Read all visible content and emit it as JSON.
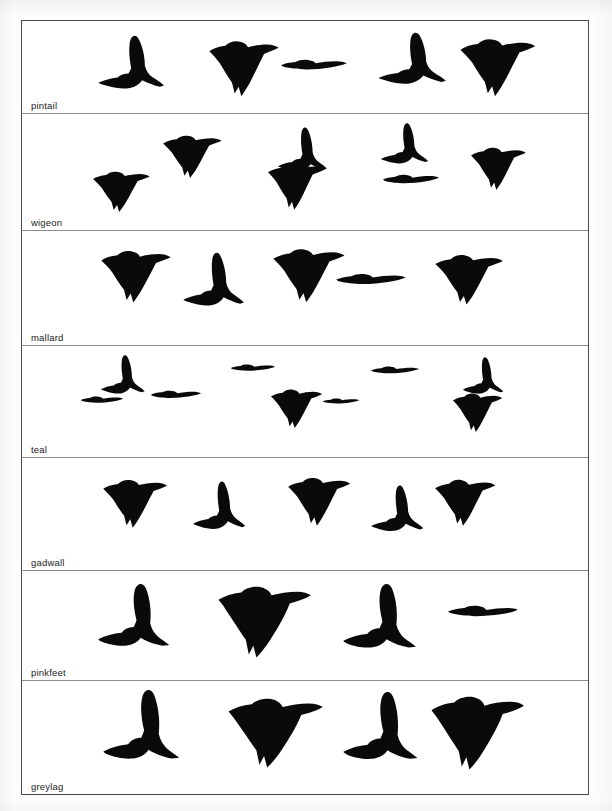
{
  "document": {
    "kind": "bird-identification-silhouette-chart",
    "subject": "wildfowl in flight silhouettes",
    "background_color": "#ffffff",
    "silhouette_color": "#0a0a0a",
    "frame_border_color": "#4a4a4a",
    "row_divider_color": "#8d8d8d"
  },
  "rows": [
    {
      "id": "pintail",
      "label": "pintail",
      "top": 0,
      "height": 93,
      "birds": [
        {
          "name": "bird-silhouette",
          "pose": "wings-up-left",
          "x": 75,
          "y": 13,
          "w": 78,
          "h": 58,
          "scale": 1.0,
          "flip": false,
          "variant": "wings-raised"
        },
        {
          "name": "bird-silhouette",
          "pose": "wings-down",
          "x": 186,
          "y": 18,
          "w": 76,
          "h": 60,
          "scale": 1.0,
          "flip": false,
          "variant": "wings-down-fan"
        },
        {
          "name": "bird-silhouette",
          "pose": "level-glide",
          "x": 258,
          "y": 38,
          "w": 68,
          "h": 34,
          "scale": 1.0,
          "flip": false,
          "variant": "level"
        },
        {
          "name": "bird-silhouette",
          "pose": "wings-up",
          "x": 355,
          "y": 10,
          "w": 80,
          "h": 56,
          "scale": 1.0,
          "flip": false,
          "variant": "wings-raised"
        },
        {
          "name": "bird-silhouette",
          "pose": "wings-down",
          "x": 437,
          "y": 16,
          "w": 82,
          "h": 62,
          "scale": 1.0,
          "flip": false,
          "variant": "wings-down-fan"
        }
      ]
    },
    {
      "id": "wigeon",
      "label": "wigeon",
      "top": 93,
      "height": 117,
      "birds": [
        {
          "name": "bird-silhouette",
          "pose": "wings-down",
          "x": 70,
          "y": 56,
          "w": 62,
          "h": 44,
          "scale": 1.0,
          "flip": false,
          "variant": "wings-down-fan"
        },
        {
          "name": "bird-silhouette",
          "pose": "wings-down",
          "x": 140,
          "y": 20,
          "w": 64,
          "h": 46,
          "scale": 1.0,
          "flip": false,
          "variant": "wings-down-fan"
        },
        {
          "name": "bird-silhouette",
          "pose": "wings-up",
          "x": 255,
          "y": 12,
          "w": 58,
          "h": 48,
          "scale": 1.0,
          "flip": false,
          "variant": "wings-raised"
        },
        {
          "name": "bird-silhouette",
          "pose": "wings-down",
          "x": 245,
          "y": 48,
          "w": 62,
          "h": 50,
          "scale": 1.0,
          "flip": false,
          "variant": "wings-down-fan"
        },
        {
          "name": "bird-silhouette",
          "pose": "wings-up",
          "x": 358,
          "y": 8,
          "w": 56,
          "h": 44,
          "scale": 1.0,
          "flip": false,
          "variant": "wings-raised"
        },
        {
          "name": "bird-silhouette",
          "pose": "level-glide",
          "x": 360,
          "y": 60,
          "w": 58,
          "h": 30,
          "scale": 1.0,
          "flip": false,
          "variant": "level"
        },
        {
          "name": "bird-silhouette",
          "pose": "wings-down",
          "x": 448,
          "y": 32,
          "w": 60,
          "h": 46,
          "scale": 1.0,
          "flip": false,
          "variant": "wings-down-fan"
        }
      ]
    },
    {
      "id": "mallard",
      "label": "mallard",
      "top": 210,
      "height": 115,
      "birds": [
        {
          "name": "bird-silhouette",
          "pose": "wings-down",
          "x": 78,
          "y": 18,
          "w": 76,
          "h": 56,
          "scale": 1.0,
          "flip": false,
          "variant": "wings-down-fan"
        },
        {
          "name": "bird-silhouette",
          "pose": "wings-up",
          "x": 160,
          "y": 20,
          "w": 72,
          "h": 58,
          "scale": 1.0,
          "flip": false,
          "variant": "wings-raised"
        },
        {
          "name": "bird-silhouette",
          "pose": "wings-down",
          "x": 250,
          "y": 16,
          "w": 78,
          "h": 58,
          "scale": 1.0,
          "flip": false,
          "variant": "wings-down-fan"
        },
        {
          "name": "bird-silhouette",
          "pose": "level-glide",
          "x": 313,
          "y": 42,
          "w": 72,
          "h": 36,
          "scale": 1.0,
          "flip": false,
          "variant": "level"
        },
        {
          "name": "bird-silhouette",
          "pose": "wings-down",
          "x": 412,
          "y": 22,
          "w": 74,
          "h": 54,
          "scale": 1.0,
          "flip": false,
          "variant": "wings-down-fan"
        }
      ]
    },
    {
      "id": "teal",
      "label": "teal",
      "top": 325,
      "height": 112,
      "birds": [
        {
          "name": "bird-silhouette",
          "pose": "wings-up",
          "x": 78,
          "y": 8,
          "w": 52,
          "h": 42,
          "scale": 1.0,
          "flip": false,
          "variant": "wings-raised"
        },
        {
          "name": "bird-silhouette",
          "pose": "level-glide",
          "x": 58,
          "y": 50,
          "w": 44,
          "h": 22,
          "scale": 1.0,
          "flip": false,
          "variant": "level"
        },
        {
          "name": "bird-silhouette",
          "pose": "level-glide",
          "x": 128,
          "y": 44,
          "w": 52,
          "h": 26,
          "scale": 1.0,
          "flip": false,
          "variant": "level"
        },
        {
          "name": "bird-silhouette",
          "pose": "level-glide",
          "x": 208,
          "y": 18,
          "w": 46,
          "h": 22,
          "scale": 1.0,
          "flip": false,
          "variant": "level"
        },
        {
          "name": "bird-silhouette",
          "pose": "wings-down",
          "x": 248,
          "y": 42,
          "w": 56,
          "h": 42,
          "scale": 1.0,
          "flip": false,
          "variant": "wings-down-fan"
        },
        {
          "name": "bird-silhouette",
          "pose": "level-glide",
          "x": 300,
          "y": 52,
          "w": 38,
          "h": 18,
          "scale": 1.0,
          "flip": false,
          "variant": "level"
        },
        {
          "name": "bird-silhouette",
          "pose": "level-glide",
          "x": 348,
          "y": 20,
          "w": 50,
          "h": 24,
          "scale": 1.0,
          "flip": false,
          "variant": "level"
        },
        {
          "name": "bird-silhouette",
          "pose": "wings-up",
          "x": 440,
          "y": 10,
          "w": 48,
          "h": 40,
          "scale": 1.0,
          "flip": false,
          "variant": "wings-raised"
        },
        {
          "name": "bird-silhouette",
          "pose": "wings-down",
          "x": 430,
          "y": 46,
          "w": 54,
          "h": 42,
          "scale": 1.0,
          "flip": false,
          "variant": "wings-down-fan"
        }
      ]
    },
    {
      "id": "gadwall",
      "label": "gadwall",
      "top": 437,
      "height": 113,
      "birds": [
        {
          "name": "bird-silhouette",
          "pose": "wings-down",
          "x": 80,
          "y": 20,
          "w": 70,
          "h": 52,
          "scale": 1.0,
          "flip": false,
          "variant": "wings-down-fan"
        },
        {
          "name": "bird-silhouette",
          "pose": "wings-up",
          "x": 170,
          "y": 22,
          "w": 62,
          "h": 52,
          "scale": 1.0,
          "flip": false,
          "variant": "wings-raised"
        },
        {
          "name": "bird-silhouette",
          "pose": "wings-down",
          "x": 265,
          "y": 18,
          "w": 68,
          "h": 52,
          "scale": 1.0,
          "flip": false,
          "variant": "wings-down-fan"
        },
        {
          "name": "bird-silhouette",
          "pose": "wings-up",
          "x": 348,
          "y": 26,
          "w": 62,
          "h": 50,
          "scale": 1.0,
          "flip": false,
          "variant": "wings-raised"
        },
        {
          "name": "bird-silhouette",
          "pose": "wings-down",
          "x": 412,
          "y": 20,
          "w": 66,
          "h": 50,
          "scale": 1.0,
          "flip": false,
          "variant": "wings-down-fan"
        }
      ]
    },
    {
      "id": "pinkfeet",
      "label": "pinkfeet",
      "top": 550,
      "height": 110,
      "birds": [
        {
          "name": "goose-silhouette",
          "pose": "wings-up",
          "x": 75,
          "y": 12,
          "w": 90,
          "h": 72,
          "scale": 1.0,
          "flip": false,
          "variant": "goose-wings-raised"
        },
        {
          "name": "goose-silhouette",
          "pose": "wings-down",
          "x": 195,
          "y": 14,
          "w": 100,
          "h": 74,
          "scale": 1.0,
          "flip": false,
          "variant": "goose-wings-down"
        },
        {
          "name": "goose-silhouette",
          "pose": "wings-up",
          "x": 320,
          "y": 12,
          "w": 92,
          "h": 74,
          "scale": 1.0,
          "flip": false,
          "variant": "goose-wings-raised"
        },
        {
          "name": "goose-silhouette",
          "pose": "level-glide",
          "x": 425,
          "y": 34,
          "w": 72,
          "h": 36,
          "scale": 1.0,
          "flip": false,
          "variant": "goose-level"
        }
      ]
    },
    {
      "id": "greylag",
      "label": "greylag",
      "top": 660,
      "height": 113,
      "birds": [
        {
          "name": "goose-silhouette",
          "pose": "wings-up",
          "x": 80,
          "y": 8,
          "w": 96,
          "h": 80,
          "scale": 1.0,
          "flip": false,
          "variant": "goose-wings-raised"
        },
        {
          "name": "goose-silhouette",
          "pose": "wings-down",
          "x": 205,
          "y": 16,
          "w": 102,
          "h": 72,
          "scale": 1.0,
          "flip": false,
          "variant": "goose-wings-down"
        },
        {
          "name": "goose-silhouette",
          "pose": "wings-up",
          "x": 320,
          "y": 10,
          "w": 94,
          "h": 78,
          "scale": 1.0,
          "flip": false,
          "variant": "goose-wings-raised"
        },
        {
          "name": "goose-silhouette",
          "pose": "wings-down",
          "x": 408,
          "y": 14,
          "w": 100,
          "h": 76,
          "scale": 1.0,
          "flip": false,
          "variant": "goose-wings-down"
        }
      ]
    }
  ],
  "shapes": {
    "wings-raised": "M2,74 C10,70 20,67 30,66 C34,62 40,60 46,60 L50,52 C48,40 46,26 48,12 C50,2 56,0 60,6 C66,16 70,34 70,48 C72,56 76,62 82,66 C88,70 94,74 98,78 L92,80 C84,78 74,74 66,70 C62,76 56,80 48,82 C38,84 26,82 16,79 C10,77 5,76 2,74 Z",
    "wings-down-fan": "M2,18 C8,14 16,11 26,10 C32,4 40,2 48,4 C54,5 58,8 60,12 C68,10 78,8 88,8 C96,8 102,10 106,13 C100,16 92,19 84,22 C80,30 74,42 68,54 C62,66 56,76 50,84 L46,70 L40,80 L36,64 C30,56 24,46 18,36 C12,28 6,22 2,18 Z",
    "level": "M2,16 C8,12 16,9 26,8 C32,3 40,1 48,3 C54,4 58,7 60,11 C70,8 82,6 94,6 C102,6 108,8 112,11 C106,15 96,19 84,22 C72,25 58,27 44,27 C30,27 16,24 8,21 C5,20 3,18 2,16 Z",
    "goose-wings-raised": "M2,78 C12,73 24,70 36,69 C40,64 46,61 54,61 L58,52 C54,36 52,20 56,8 C60,-1 68,-1 72,8 C78,22 80,42 78,56 C80,64 84,70 90,75 C96,79 102,83 106,86 L96,87 C84,85 72,81 64,76 C60,82 52,86 42,87 C30,88 16,85 8,82 C4,80 2,79 2,78 Z",
    "goose-wings-down": "M2,20 C10,15 20,11 32,10 C38,4 48,1 58,3 C66,5 70,9 72,14 C82,11 94,9 106,9 C114,9 120,11 124,14 C118,18 108,22 96,25 C92,36 84,52 74,68 C66,82 58,92 52,98 L48,82 L42,94 L38,74 C30,62 20,46 12,34 C8,27 4,23 2,20 Z",
    "goose-level": "M2,18 C10,13 20,9 32,8 C38,3 48,1 58,3 C66,5 70,9 72,14 C84,10 98,8 112,8 C120,8 126,10 130,13 C124,18 112,23 98,26 C84,29 68,31 52,31 C36,31 18,27 8,23 C4,21 2,19 2,18 Z"
  }
}
